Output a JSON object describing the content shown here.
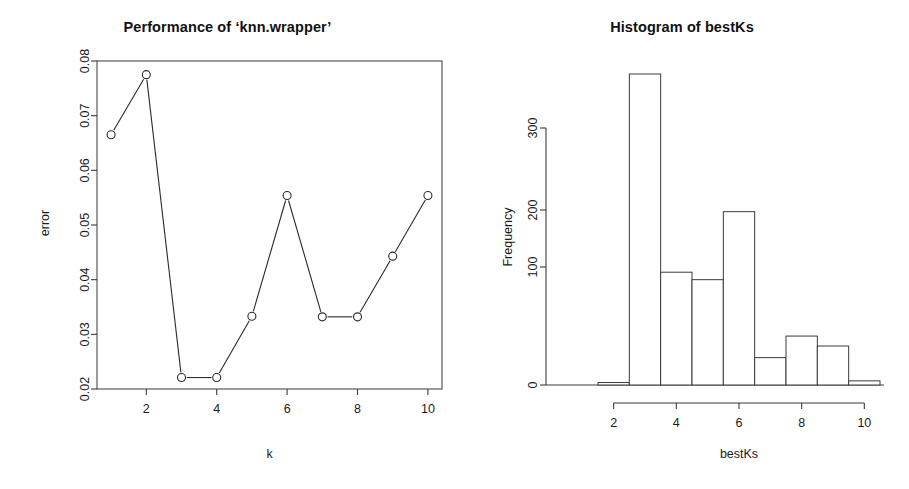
{
  "figure": {
    "background": "#ffffff",
    "ink_color": "#2b2b2b",
    "width": 909,
    "height": 489
  },
  "chart_data": [
    {
      "type": "line",
      "panel": "left",
      "title": "Performance of ‘knn.wrapper’",
      "xlabel": "k",
      "ylabel": "error",
      "x": [
        1,
        2,
        3,
        4,
        5,
        6,
        7,
        8,
        9,
        10
      ],
      "values": [
        0.0665,
        0.0775,
        0.0221,
        0.0221,
        0.0333,
        0.0554,
        0.0332,
        0.0332,
        0.0443,
        0.0554
      ],
      "marker": "open-circle",
      "line": "solid",
      "xlim": [
        0.6,
        10.4
      ],
      "ylim": [
        0.02,
        0.08
      ],
      "xticks": [
        2,
        4,
        6,
        8,
        10
      ],
      "xticklabels": [
        "2",
        "4",
        "6",
        "8",
        "10"
      ],
      "yticks": [
        0.02,
        0.03,
        0.04,
        0.05,
        0.06,
        0.07,
        0.08
      ],
      "yticklabels": [
        "0.02",
        "0.03",
        "0.04",
        "0.05",
        "0.06",
        "0.07",
        "0.08"
      ],
      "grid": false,
      "legend": "none",
      "frame": "box"
    },
    {
      "type": "bar",
      "panel": "right",
      "title": "Histogram of bestKs",
      "xlabel": "bestKs",
      "ylabel": "Frequency",
      "bin_edges": [
        1.5,
        2.5,
        3.5,
        4.5,
        5.5,
        6.5,
        7.5,
        8.5,
        9.5,
        10.5
      ],
      "categories": [
        "1.5-2.5",
        "2.5-3.5",
        "3.5-4.5",
        "4.5-5.5",
        "5.5-6.5",
        "6.5-7.5",
        "7.5-8.5",
        "8.5-9.5",
        "9.5-10.5"
      ],
      "values": [
        3,
        375,
        136,
        127,
        209,
        33,
        59,
        47,
        5
      ],
      "xlim": [
        1.0,
        11.0
      ],
      "ylim": [
        0,
        380
      ],
      "xticks": [
        2,
        4,
        6,
        8,
        10
      ],
      "xticklabels": [
        "2",
        "4",
        "6",
        "8",
        "10"
      ],
      "yticks": [
        0,
        100,
        200,
        300
      ],
      "yticklabels": [
        "0",
        "100",
        "200",
        "300"
      ],
      "grid": false,
      "legend": "none",
      "frame": "axes-only"
    }
  ]
}
